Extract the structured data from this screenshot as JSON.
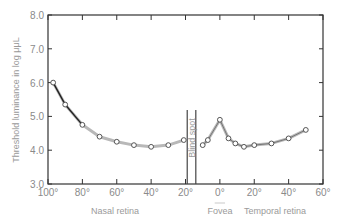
{
  "chart_data": {
    "type": "line",
    "title": "",
    "ylabel": "Threshold luminance in log μμL",
    "xlabel_groups": [
      {
        "label": "Nasal retina",
        "center_deg": -60
      },
      {
        "label": "Fovea",
        "center_deg": 0
      },
      {
        "label": "Temporal retina",
        "center_deg": 32
      }
    ],
    "ylim": [
      3.0,
      8.0
    ],
    "xlim": [
      -100,
      60
    ],
    "y_ticks": [
      "3.0",
      "4.0",
      "5.0",
      "6.0",
      "7.0",
      "8.0"
    ],
    "x_ticks": [
      {
        "deg": -100,
        "label": "100°"
      },
      {
        "deg": -80,
        "label": "80°"
      },
      {
        "deg": -60,
        "label": "60°"
      },
      {
        "deg": -40,
        "label": "40°"
      },
      {
        "deg": -20,
        "label": "20°"
      },
      {
        "deg": 0,
        "label": "0°"
      },
      {
        "deg": 20,
        "label": "20°"
      },
      {
        "deg": 40,
        "label": "40°"
      },
      {
        "deg": 60,
        "label": "60°"
      }
    ],
    "annotation": {
      "label": "Blind spot",
      "from_deg": -19,
      "to_deg": -14
    },
    "series": [
      {
        "name": "Nasal",
        "x": [
          -97,
          -90,
          -80,
          -70,
          -60,
          -50,
          -40,
          -30,
          -21
        ],
        "y": [
          6.0,
          5.35,
          4.75,
          4.4,
          4.25,
          4.15,
          4.1,
          4.15,
          4.3
        ]
      },
      {
        "name": "Temporal",
        "x": [
          -10,
          -7,
          0,
          5,
          9,
          14,
          20,
          30,
          40,
          50
        ],
        "y": [
          4.15,
          4.3,
          4.9,
          4.35,
          4.2,
          4.1,
          4.15,
          4.2,
          4.35,
          4.6
        ]
      }
    ],
    "grid": false,
    "legend": null
  },
  "labels": {
    "ylabel": "Threshold luminance in log μμL",
    "nasal": "Nasal retina",
    "fovea": "Fovea",
    "temporal": "Temporal retina",
    "blind_spot": "Blind spot"
  },
  "colors": {
    "axis": "#333333",
    "curve_dark": "#222222",
    "curve_light": "#b8b8b8",
    "marker_fill": "#ffffff",
    "marker_stroke": "#555555"
  }
}
